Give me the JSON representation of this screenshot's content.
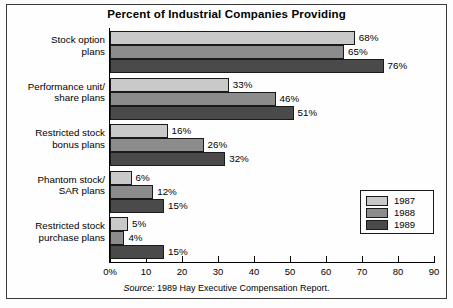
{
  "chart_data": {
    "type": "bar",
    "orientation": "horizontal",
    "title": "Percent of Industrial Companies Providing",
    "xlabel": "",
    "ylabel": "",
    "xlim": [
      0,
      90
    ],
    "grid": false,
    "legend_position": "right-middle",
    "categories": [
      "Stock option plans",
      "Performance unit/ share plans",
      "Restricted stock bonus plans",
      "Phantom stock/ SAR plans",
      "Restricted stock purchase plans"
    ],
    "category_lines": [
      [
        "Stock option",
        "plans"
      ],
      [
        "Performance unit/",
        "share plans"
      ],
      [
        "Restricted stock",
        "bonus plans"
      ],
      [
        "Phantom stock/",
        "SAR plans"
      ],
      [
        "Restricted stock",
        "purchase plans"
      ]
    ],
    "series": [
      {
        "name": "1987",
        "color": "#c9c9c9",
        "values": [
          68,
          33,
          16,
          6,
          5
        ],
        "labels": [
          "68%",
          "33%",
          "16%",
          "6%",
          "5%"
        ]
      },
      {
        "name": "1988",
        "color": "#8c8c8c",
        "values": [
          65,
          46,
          26,
          12,
          4
        ],
        "labels": [
          "65%",
          "46%",
          "26%",
          "12%",
          "4%"
        ]
      },
      {
        "name": "1989",
        "color": "#4a4a4a",
        "values": [
          76,
          51,
          32,
          15,
          15
        ],
        "labels": [
          "76%",
          "51%",
          "32%",
          "15%",
          "15%"
        ]
      }
    ],
    "xticks": [
      0,
      10,
      20,
      30,
      40,
      50,
      60,
      70,
      80,
      90
    ],
    "xtick_labels": [
      "0%",
      "10",
      "20",
      "30",
      "40",
      "50",
      "60",
      "70",
      "80",
      "90"
    ]
  },
  "legend": {
    "entries": [
      {
        "label": "1987",
        "color": "#c9c9c9"
      },
      {
        "label": "1988",
        "color": "#8c8c8c"
      },
      {
        "label": "1989",
        "color": "#4a4a4a"
      }
    ]
  },
  "source": {
    "prefix": "Source:",
    "text": "1989 Hay Executive Compensation Report."
  }
}
